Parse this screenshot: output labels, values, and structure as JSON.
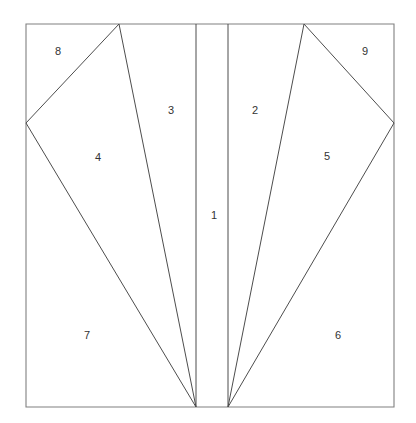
{
  "figure": {
    "title": "",
    "background_color": "#ffffff",
    "line_color": "#4d4d4d",
    "frame_color": "#808080",
    "label_color": "#333333",
    "width": 416,
    "height": 423
  },
  "chart_data": {
    "type": "diagram",
    "title": "",
    "xlim": [
      0,
      416
    ],
    "ylim": [
      0,
      423
    ],
    "grid": false,
    "legend": null,
    "frame": {
      "name": "outer-rectangle",
      "points": [
        [
          26,
          24
        ],
        [
          394,
          24
        ],
        [
          394,
          407
        ],
        [
          26,
          407
        ]
      ]
    },
    "vertices": {
      "top_left": [
        26,
        24
      ],
      "top_right": [
        394,
        24
      ],
      "bottom_left": [
        26,
        407
      ],
      "bottom_right": [
        394,
        407
      ],
      "left_edge_vertex": [
        26,
        123
      ],
      "right_edge_vertex": [
        394,
        123
      ],
      "left_top_apex": [
        119,
        24
      ],
      "right_top_apex": [
        304,
        24
      ],
      "left_bottom_apex": [
        196,
        407
      ],
      "right_bottom_apex": [
        228,
        407
      ],
      "left_strip_top": [
        196,
        24
      ],
      "right_strip_top": [
        228,
        24
      ]
    },
    "segments": [
      {
        "name": "left-strip-line",
        "from": [
          196,
          24
        ],
        "to": [
          196,
          407
        ]
      },
      {
        "name": "right-strip-line",
        "from": [
          228,
          24
        ],
        "to": [
          228,
          407
        ]
      },
      {
        "name": "left-ray-to-top-apex",
        "from": [
          196,
          407
        ],
        "to": [
          119,
          24
        ]
      },
      {
        "name": "left-ray-to-edge-vertex",
        "from": [
          196,
          407
        ],
        "to": [
          26,
          123
        ]
      },
      {
        "name": "left-diagonal-upper",
        "from": [
          26,
          123
        ],
        "to": [
          119,
          24
        ]
      },
      {
        "name": "right-ray-to-top-apex",
        "from": [
          228,
          407
        ],
        "to": [
          304,
          24
        ]
      },
      {
        "name": "right-ray-to-edge-vertex",
        "from": [
          228,
          407
        ],
        "to": [
          394,
          123
        ]
      },
      {
        "name": "right-diagonal-upper",
        "from": [
          304,
          24
        ],
        "to": [
          394,
          123
        ]
      }
    ],
    "regions": [
      {
        "id": "1",
        "label": "1",
        "label_pos": [
          214,
          216
        ],
        "polygon": [
          [
            196,
            24
          ],
          [
            228,
            24
          ],
          [
            228,
            407
          ],
          [
            196,
            407
          ]
        ]
      },
      {
        "id": "2",
        "label": "2",
        "label_pos": [
          255,
          111
        ],
        "polygon": [
          [
            228,
            24
          ],
          [
            304,
            24
          ],
          [
            228,
            407
          ]
        ]
      },
      {
        "id": "3",
        "label": "3",
        "label_pos": [
          171,
          111
        ],
        "polygon": [
          [
            119,
            24
          ],
          [
            196,
            24
          ],
          [
            196,
            407
          ]
        ]
      },
      {
        "id": "4",
        "label": "4",
        "label_pos": [
          98,
          158
        ],
        "polygon": [
          [
            26,
            123
          ],
          [
            119,
            24
          ],
          [
            196,
            407
          ]
        ]
      },
      {
        "id": "5",
        "label": "5",
        "label_pos": [
          327,
          157
        ],
        "polygon": [
          [
            304,
            24
          ],
          [
            394,
            123
          ],
          [
            228,
            407
          ]
        ]
      },
      {
        "id": "6",
        "label": "6",
        "label_pos": [
          338,
          336
        ],
        "polygon": [
          [
            394,
            123
          ],
          [
            394,
            407
          ],
          [
            228,
            407
          ]
        ]
      },
      {
        "id": "7",
        "label": "7",
        "label_pos": [
          87,
          336
        ],
        "polygon": [
          [
            26,
            123
          ],
          [
            196,
            407
          ],
          [
            26,
            407
          ]
        ]
      },
      {
        "id": "8",
        "label": "8",
        "label_pos": [
          58,
          52
        ],
        "polygon": [
          [
            26,
            24
          ],
          [
            119,
            24
          ],
          [
            26,
            123
          ]
        ]
      },
      {
        "id": "9",
        "label": "9",
        "label_pos": [
          365,
          52
        ],
        "polygon": [
          [
            304,
            24
          ],
          [
            394,
            24
          ],
          [
            394,
            123
          ]
        ]
      }
    ]
  }
}
